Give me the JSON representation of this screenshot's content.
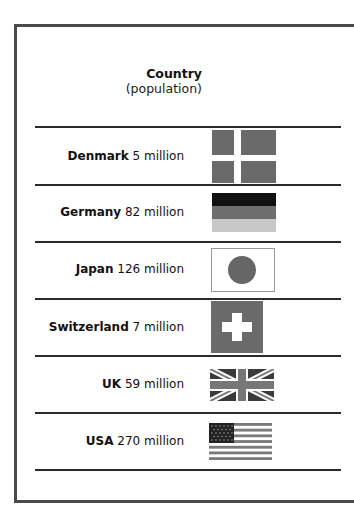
{
  "header": {
    "title": "Country",
    "subtitle": "(population)"
  },
  "rows": [
    {
      "country": "Denmark",
      "population": " 5 million",
      "flag": "denmark-flag-icon"
    },
    {
      "country": "Germany",
      "population": " 82 million",
      "flag": "germany-flag-icon"
    },
    {
      "country": "Japan",
      "population": " 126 million",
      "flag": "japan-flag-icon"
    },
    {
      "country": "Switzerland",
      "population": " 7 million",
      "flag": "switzerland-flag-icon"
    },
    {
      "country": "UK",
      "population": " 59 million",
      "flag": "uk-flag-icon"
    },
    {
      "country": "USA",
      "population": " 270 million",
      "flag": "usa-flag-icon"
    }
  ],
  "colors": {
    "border": "#4a4a4a",
    "flag_gray": "#6a6a6a",
    "flag_light": "#c8c8c8",
    "flag_black": "#111111"
  }
}
